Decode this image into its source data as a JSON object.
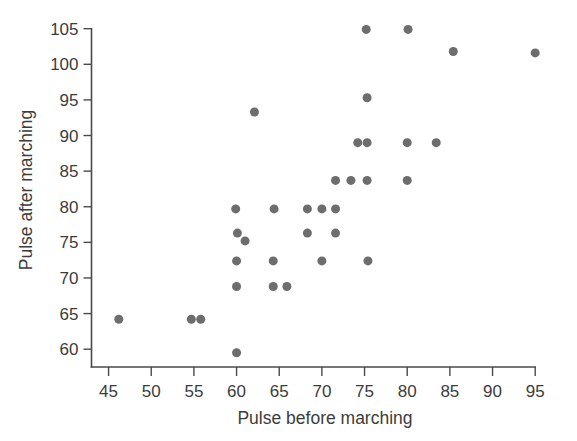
{
  "chart_data": {
    "type": "scatter",
    "title": "",
    "xlabel": "Pulse before marching",
    "ylabel": "Pulse after marching",
    "xlim": [
      43.0,
      96.5
    ],
    "ylim": [
      57.5,
      106.5
    ],
    "xticks": [
      45,
      50,
      55,
      60,
      65,
      70,
      75,
      80,
      85,
      90,
      95
    ],
    "yticks": [
      60,
      65,
      70,
      75,
      80,
      85,
      90,
      95,
      100,
      105
    ],
    "xtick_labels": [
      "45",
      "50",
      "55",
      "60",
      "65",
      "70",
      "75",
      "80",
      "85",
      "90",
      "95"
    ],
    "ytick_labels": [
      "60",
      "65",
      "70",
      "75",
      "80",
      "85",
      "90",
      "95",
      "100",
      "105"
    ],
    "grid": false,
    "legend": false,
    "marker_color": "#6d6d6d",
    "marker_size": 9,
    "axis_color": "#4a4a4a",
    "background": "#ffffff",
    "points": [
      {
        "x": 46.2,
        "y": 64.2
      },
      {
        "x": 54.7,
        "y": 64.2
      },
      {
        "x": 55.8,
        "y": 64.2
      },
      {
        "x": 60.0,
        "y": 59.5
      },
      {
        "x": 60.0,
        "y": 68.8
      },
      {
        "x": 60.0,
        "y": 72.4
      },
      {
        "x": 60.1,
        "y": 76.3
      },
      {
        "x": 59.9,
        "y": 79.7
      },
      {
        "x": 61.0,
        "y": 75.2
      },
      {
        "x": 62.1,
        "y": 93.3
      },
      {
        "x": 64.3,
        "y": 68.8
      },
      {
        "x": 64.3,
        "y": 72.4
      },
      {
        "x": 64.4,
        "y": 79.7
      },
      {
        "x": 65.9,
        "y": 68.8
      },
      {
        "x": 68.3,
        "y": 76.3
      },
      {
        "x": 68.3,
        "y": 79.7
      },
      {
        "x": 70.0,
        "y": 72.4
      },
      {
        "x": 70.0,
        "y": 79.7
      },
      {
        "x": 71.6,
        "y": 76.3
      },
      {
        "x": 71.6,
        "y": 79.7
      },
      {
        "x": 71.6,
        "y": 83.7
      },
      {
        "x": 73.4,
        "y": 83.7
      },
      {
        "x": 74.2,
        "y": 89.0
      },
      {
        "x": 75.3,
        "y": 83.7
      },
      {
        "x": 75.3,
        "y": 89.0
      },
      {
        "x": 75.4,
        "y": 72.4
      },
      {
        "x": 75.3,
        "y": 95.3
      },
      {
        "x": 75.2,
        "y": 104.9
      },
      {
        "x": 80.0,
        "y": 83.7
      },
      {
        "x": 80.0,
        "y": 89.0
      },
      {
        "x": 80.1,
        "y": 104.9
      },
      {
        "x": 83.4,
        "y": 89.0
      },
      {
        "x": 85.4,
        "y": 101.8
      },
      {
        "x": 95.0,
        "y": 101.6
      }
    ]
  }
}
